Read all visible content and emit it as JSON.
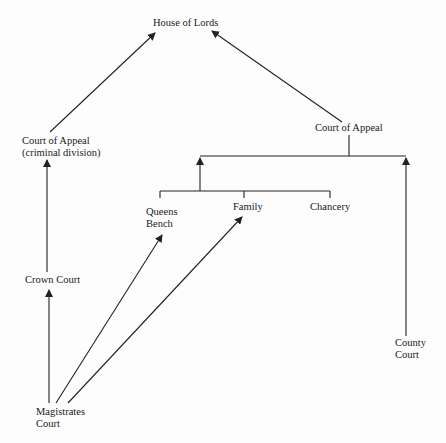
{
  "diagram": {
    "nodes": {
      "house_of_lords": {
        "label": "House of Lords"
      },
      "court_of_appeal_criminal": {
        "line1": "Court of Appeal",
        "line2": "(criminal division)"
      },
      "court_of_appeal_civil": {
        "label": "Court of Appeal"
      },
      "queens_bench": {
        "line1": "Queens",
        "line2": "Bench"
      },
      "family": {
        "label": "Family"
      },
      "chancery": {
        "label": "Chancery"
      },
      "crown_court": {
        "label": "Crown Court"
      },
      "county_court": {
        "line1": "County",
        "line2": "Court"
      },
      "magistrates_court": {
        "line1": "Magistrates",
        "line2": "Court"
      }
    },
    "edges": [
      {
        "from": "Court of Appeal (criminal division)",
        "to": "House of Lords"
      },
      {
        "from": "Court of Appeal",
        "to": "House of Lords"
      },
      {
        "from": "High Court (Queens Bench / Family / Chancery)",
        "to": "Court of Appeal"
      },
      {
        "from": "County Court",
        "to": "Court of Appeal"
      },
      {
        "from": "Crown Court",
        "to": "Court of Appeal (criminal division)"
      },
      {
        "from": "Magistrates Court",
        "to": "Crown Court"
      },
      {
        "from": "Magistrates Court",
        "to": "Queens Bench"
      },
      {
        "from": "Magistrates Court",
        "to": "Family"
      }
    ],
    "colors": {
      "line": "#222222",
      "background": "#fdfdfd"
    }
  }
}
